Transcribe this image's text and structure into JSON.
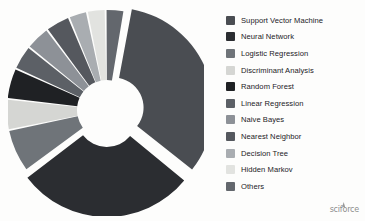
{
  "figure": {
    "background_color": "#fdfdfc",
    "brand_text": "sciforce"
  },
  "legend": {
    "position": "right",
    "items": [
      {
        "label": "Support Vector Machine",
        "color": "#4a4d52"
      },
      {
        "label": "Neural Network",
        "color": "#2b2d31"
      },
      {
        "label": "Logistic Regression",
        "color": "#6f7479"
      },
      {
        "label": "Discriminant Analysis",
        "color": "#d5d6d3"
      },
      {
        "label": "Random Forest",
        "color": "#1f2124"
      },
      {
        "label": "Linear Regression",
        "color": "#5c6066"
      },
      {
        "label": "Naive Bayes",
        "color": "#8d9197"
      },
      {
        "label": "Nearest Neighbor",
        "color": "#55585e"
      },
      {
        "label": "Decision Tree",
        "color": "#a9adb1"
      },
      {
        "label": "Hidden Markov",
        "color": "#e2e3e0"
      },
      {
        "label": "Others",
        "color": "#63676d"
      }
    ]
  },
  "chart_data": {
    "type": "pie",
    "variant": "donut-exploded",
    "title": "",
    "subtitle": "",
    "xlabel": "",
    "ylabel": "",
    "grid": false,
    "legend_position": "right",
    "hole_ratio": 0.3,
    "start_angle_deg": -80,
    "direction": "clockwise",
    "labels": [
      "Support Vector Machine",
      "Neural Network",
      "Logistic Regression",
      "Discriminant Analysis",
      "Random Forest",
      "Linear Regression",
      "Naive Bayes",
      "Nearest Neighbor",
      "Decision Tree",
      "Hidden Markov",
      "Others"
    ],
    "values": [
      33,
      29,
      7,
      5,
      5,
      4,
      4,
      4,
      3,
      3,
      3
    ],
    "unit": "percent",
    "colors": [
      "#4a4d52",
      "#2b2d31",
      "#6f7479",
      "#d5d6d3",
      "#1f2124",
      "#5c6066",
      "#8d9197",
      "#55585e",
      "#a9adb1",
      "#e2e3e0",
      "#63676d"
    ],
    "exploded": [
      true,
      true,
      false,
      false,
      false,
      false,
      false,
      false,
      false,
      false,
      false
    ],
    "annotations": []
  }
}
